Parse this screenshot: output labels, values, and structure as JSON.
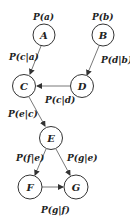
{
  "diagram": {
    "type": "bayesian-network",
    "colors": {
      "stroke": "#333333",
      "text": "#222222",
      "background": "#ffffff"
    },
    "nodes": [
      {
        "id": "A",
        "label": "A",
        "x": 44,
        "y": 35,
        "prior": "P(a)"
      },
      {
        "id": "B",
        "label": "B",
        "x": 103,
        "y": 35,
        "prior": "P(b)"
      },
      {
        "id": "C",
        "label": "C",
        "x": 24,
        "y": 86
      },
      {
        "id": "D",
        "label": "D",
        "x": 82,
        "y": 86
      },
      {
        "id": "E",
        "label": "E",
        "x": 51,
        "y": 138
      },
      {
        "id": "F",
        "label": "F",
        "x": 30,
        "y": 187
      },
      {
        "id": "G",
        "label": "G",
        "x": 76,
        "y": 187
      }
    ],
    "edges": [
      {
        "from": "A",
        "to": "C",
        "label": "P(c|a)"
      },
      {
        "from": "B",
        "to": "D",
        "label": "P(d|b)"
      },
      {
        "from": "D",
        "to": "C",
        "label": "P(c|d)"
      },
      {
        "from": "C",
        "to": "E",
        "label": "P(e|c)"
      },
      {
        "from": "E",
        "to": "F",
        "label": "P(f|e)"
      },
      {
        "from": "E",
        "to": "G",
        "label": "P(g|e)"
      },
      {
        "from": "F",
        "to": "G",
        "label": "P(g|f)"
      }
    ]
  }
}
